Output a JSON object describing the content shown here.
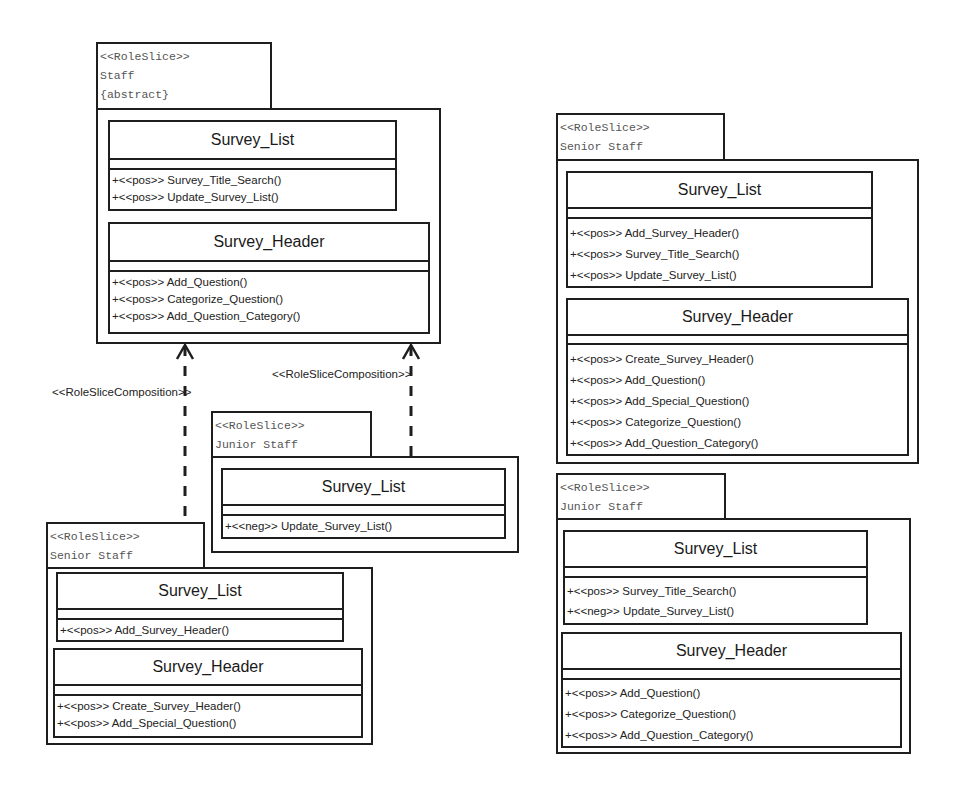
{
  "diagram": {
    "connectors": [
      {
        "label": "<<RoleSliceComposition>>",
        "from": "senior-staff-left",
        "to": "staff"
      },
      {
        "label": "<<RoleSliceComposition>>",
        "from": "junior-staff-left",
        "to": "staff"
      }
    ],
    "role_slices": [
      {
        "id": "staff",
        "stereotype": "<<RoleSlice>>",
        "name": "Staff",
        "modifier": "{abstract}",
        "classes": [
          {
            "name": "Survey_List",
            "operations": [
              "+<<pos>> Survey_Title_Search()",
              "+<<pos>> Update_Survey_List()"
            ]
          },
          {
            "name": "Survey_Header",
            "operations": [
              "+<<pos>> Add_Question()",
              "+<<pos>> Categorize_Question()",
              "+<<pos>> Add_Question_Category()"
            ]
          }
        ]
      },
      {
        "id": "junior-staff-left",
        "stereotype": "<<RoleSlice>>",
        "name": "Junior Staff",
        "classes": [
          {
            "name": "Survey_List",
            "operations": [
              "+<<neg>> Update_Survey_List()"
            ]
          }
        ]
      },
      {
        "id": "senior-staff-left",
        "stereotype": "<<RoleSlice>>",
        "name": "Senior Staff",
        "classes": [
          {
            "name": "Survey_List",
            "operations": [
              "+<<pos>> Add_Survey_Header()"
            ]
          },
          {
            "name": "Survey_Header",
            "operations": [
              "+<<pos>> Create_Survey_Header()",
              "+<<pos>> Add_Special_Question()"
            ]
          }
        ]
      },
      {
        "id": "senior-staff-right",
        "stereotype": "<<RoleSlice>>",
        "name": "Senior Staff",
        "classes": [
          {
            "name": "Survey_List",
            "operations": [
              "+<<pos>> Add_Survey_Header()",
              "+<<pos>> Survey_Title_Search()",
              "+<<pos>> Update_Survey_List()"
            ]
          },
          {
            "name": "Survey_Header",
            "operations": [
              "+<<pos>> Create_Survey_Header()",
              "+<<pos>> Add_Question()",
              "+<<pos>> Add_Special_Question()",
              "+<<pos>> Categorize_Question()",
              "+<<pos>> Add_Question_Category()"
            ]
          }
        ]
      },
      {
        "id": "junior-staff-right",
        "stereotype": "<<RoleSlice>>",
        "name": "Junior Staff",
        "classes": [
          {
            "name": "Survey_List",
            "operations": [
              "+<<pos>> Survey_Title_Search()",
              "+<<neg>> Update_Survey_List()"
            ]
          },
          {
            "name": "Survey_Header",
            "operations": [
              "+<<pos>> Add_Question()",
              "+<<pos>> Categorize_Question()",
              "+<<pos>> Add_Question_Category()"
            ]
          }
        ]
      }
    ]
  }
}
